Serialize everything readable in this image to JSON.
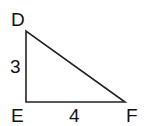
{
  "diagram": {
    "type": "right-triangle",
    "vertices": [
      {
        "label": "D",
        "x": 26,
        "y": 31
      },
      {
        "label": "E",
        "x": 26,
        "y": 102
      },
      {
        "label": "F",
        "x": 125,
        "y": 102
      }
    ],
    "sides": [
      {
        "from": "D",
        "to": "E",
        "length_label": "3"
      },
      {
        "from": "E",
        "to": "F",
        "length_label": "4"
      },
      {
        "from": "D",
        "to": "F",
        "length_label": ""
      }
    ],
    "right_angle_at": "E",
    "stroke_color": "#222222"
  }
}
